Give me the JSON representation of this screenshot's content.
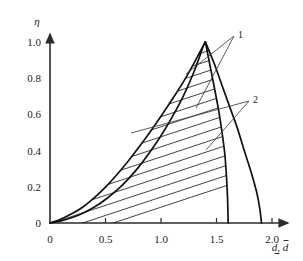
{
  "chart_data": {
    "type": "line",
    "title": "",
    "xlabel": "d, d̄",
    "ylabel": "η",
    "xlim": [
      0,
      2.0
    ],
    "ylim": [
      0,
      1.0
    ],
    "grid": false,
    "legend_position": "right-inline-callouts",
    "x_ticks": [
      "0",
      "0.5",
      "1.0",
      "1.5",
      "2.0"
    ],
    "x_tick_values": [
      0,
      0.5,
      1.0,
      1.5,
      2.0
    ],
    "y_ticks": [
      "0",
      "0.2",
      "0.4",
      "0.6",
      "0.8",
      "1.0"
    ],
    "y_tick_values": [
      0,
      0.2,
      0.4,
      0.6,
      0.8,
      1.0
    ],
    "annotations": [
      {
        "label": "1",
        "x": 1.83,
        "y": 0.955
      },
      {
        "label": "2",
        "x": 1.92,
        "y": 0.715
      }
    ],
    "series": [
      {
        "name": "1-rising",
        "label": "1",
        "points": [
          [
            0.0,
            0.0
          ],
          [
            0.1,
            0.012
          ],
          [
            0.2,
            0.03
          ],
          [
            0.3,
            0.055
          ],
          [
            0.4,
            0.088
          ],
          [
            0.5,
            0.13
          ],
          [
            0.6,
            0.18
          ],
          [
            0.7,
            0.24
          ],
          [
            0.8,
            0.31
          ],
          [
            0.9,
            0.392
          ],
          [
            1.0,
            0.482
          ],
          [
            1.1,
            0.585
          ],
          [
            1.2,
            0.7
          ],
          [
            1.3,
            0.84
          ],
          [
            1.38,
            0.975
          ],
          [
            1.4,
            1.0
          ]
        ]
      },
      {
        "name": "1-falling",
        "label": "1",
        "points": [
          [
            1.4,
            1.0
          ],
          [
            1.48,
            0.88
          ],
          [
            1.55,
            0.76
          ],
          [
            1.62,
            0.64
          ],
          [
            1.69,
            0.52
          ],
          [
            1.75,
            0.4
          ],
          [
            1.81,
            0.285
          ],
          [
            1.86,
            0.175
          ],
          [
            1.89,
            0.08
          ],
          [
            1.905,
            0.0
          ]
        ]
      },
      {
        "name": "2-rising",
        "label": "2",
        "points": [
          [
            0.0,
            0.0
          ],
          [
            0.1,
            0.022
          ],
          [
            0.2,
            0.052
          ],
          [
            0.3,
            0.09
          ],
          [
            0.4,
            0.14
          ],
          [
            0.5,
            0.198
          ],
          [
            0.6,
            0.265
          ],
          [
            0.7,
            0.338
          ],
          [
            0.8,
            0.418
          ],
          [
            0.9,
            0.502
          ],
          [
            1.0,
            0.59
          ],
          [
            1.1,
            0.682
          ],
          [
            1.2,
            0.778
          ],
          [
            1.3,
            0.886
          ],
          [
            1.37,
            0.968
          ],
          [
            1.4,
            1.0
          ]
        ]
      },
      {
        "name": "2-falling",
        "label": "2",
        "points": [
          [
            1.4,
            1.0
          ],
          [
            1.44,
            0.875
          ],
          [
            1.48,
            0.75
          ],
          [
            1.52,
            0.62
          ],
          [
            1.55,
            0.5
          ],
          [
            1.575,
            0.38
          ],
          [
            1.59,
            0.255
          ],
          [
            1.6,
            0.13
          ],
          [
            1.605,
            0.0
          ]
        ]
      }
    ],
    "hatched_region": {
      "description": "area bounded by curve 2-rising on the left and curve 2-falling on the right",
      "hatch_direction": "lower-left to upper-right",
      "hatch_count": 18
    }
  }
}
